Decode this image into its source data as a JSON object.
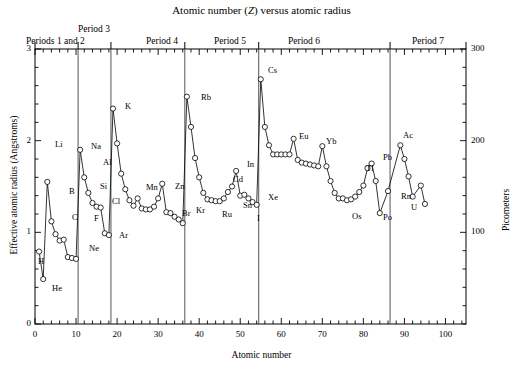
{
  "title": "Atomic number (Z) versus atomic radius",
  "title_parts": {
    "before": "Atomic number (",
    "italic": "Z",
    "after": ") versus atomic radius"
  },
  "axes": {
    "x": {
      "label": "Atomic number",
      "min": 0,
      "max": 105,
      "major_ticks": [
        0,
        10,
        20,
        30,
        40,
        50,
        60,
        70,
        80,
        90,
        100
      ],
      "minor_step": 2
    },
    "y_left": {
      "label": "Effective atomic radius (Angstroms)",
      "min": 0,
      "max": 3,
      "major_ticks": [
        0,
        1,
        2,
        3
      ],
      "minor_step": 0.2
    },
    "y_right": {
      "label": "Picometers",
      "min": 0,
      "max": 300,
      "major_ticks": [
        100,
        200,
        300
      ],
      "minor_step": 20
    }
  },
  "period_headers": [
    {
      "id": "p12",
      "label": "Periods 1 and 2"
    },
    {
      "id": "p3",
      "label": "Period 3"
    },
    {
      "id": "p4",
      "label": "Period 4"
    },
    {
      "id": "p5",
      "label": "Period 5"
    },
    {
      "id": "p6",
      "label": "Period 6"
    },
    {
      "id": "p7",
      "label": "Period 7"
    }
  ],
  "period_dividers_z": [
    10.5,
    18.5,
    36.5,
    54.5,
    86.5
  ],
  "style": {
    "line_color": "#000000",
    "marker_fill": "#ffffff",
    "divider_color": "#555555",
    "frame_color": "#000000"
  },
  "chart_data": {
    "type": "line",
    "title": "Atomic number (Z) versus atomic radius",
    "xlabel": "Atomic number",
    "ylabel": "Effective atomic radius (Angstroms)",
    "y2label": "Picometers",
    "xlim": [
      0,
      105
    ],
    "ylim": [
      0,
      3
    ],
    "y2lim": [
      0,
      300
    ],
    "grid": false,
    "legend": "none",
    "marker": "open-circle",
    "x": [
      1,
      2,
      3,
      4,
      5,
      6,
      7,
      8,
      9,
      10,
      11,
      12,
      13,
      14,
      15,
      16,
      17,
      18,
      19,
      20,
      21,
      22,
      23,
      24,
      25,
      26,
      27,
      28,
      29,
      30,
      31,
      32,
      33,
      34,
      35,
      36,
      37,
      38,
      39,
      40,
      41,
      42,
      43,
      44,
      45,
      46,
      47,
      48,
      49,
      50,
      51,
      52,
      53,
      54,
      55,
      56,
      57,
      58,
      59,
      60,
      61,
      62,
      63,
      64,
      65,
      66,
      67,
      68,
      69,
      70,
      71,
      72,
      73,
      74,
      75,
      76,
      77,
      78,
      79,
      80,
      81,
      82,
      83,
      84,
      86,
      89,
      90,
      91,
      92,
      94,
      95
    ],
    "values": [
      0.79,
      0.49,
      1.55,
      1.12,
      0.98,
      0.91,
      0.92,
      0.73,
      0.72,
      0.71,
      1.9,
      1.6,
      1.43,
      1.32,
      1.28,
      1.27,
      0.99,
      0.97,
      2.35,
      1.97,
      1.64,
      1.47,
      1.35,
      1.29,
      1.37,
      1.26,
      1.25,
      1.25,
      1.28,
      1.37,
      1.53,
      1.22,
      1.21,
      1.17,
      1.14,
      1.1,
      2.48,
      2.15,
      1.81,
      1.6,
      1.43,
      1.36,
      1.35,
      1.34,
      1.34,
      1.37,
      1.44,
      1.5,
      1.67,
      1.4,
      1.41,
      1.37,
      1.33,
      1.3,
      2.67,
      2.15,
      1.95,
      1.85,
      1.85,
      1.85,
      1.85,
      1.85,
      2.02,
      1.79,
      1.76,
      1.75,
      1.74,
      1.73,
      1.72,
      1.94,
      1.72,
      1.56,
      1.43,
      1.37,
      1.37,
      1.35,
      1.36,
      1.39,
      1.44,
      1.51,
      1.7,
      1.75,
      1.56,
      1.21,
      1.45,
      1.95,
      1.8,
      1.61,
      1.39,
      1.51,
      1.31
    ],
    "annotations": [
      {
        "label": "H",
        "z": 1
      },
      {
        "label": "He",
        "z": 2
      },
      {
        "label": "Li",
        "z": 3
      },
      {
        "label": "B",
        "z": 5
      },
      {
        "label": "C",
        "z": 6
      },
      {
        "label": "F",
        "z": 9
      },
      {
        "label": "Ne",
        "z": 10
      },
      {
        "label": "Na",
        "z": 11
      },
      {
        "label": "Al",
        "z": 13
      },
      {
        "label": "Si",
        "z": 14
      },
      {
        "label": "Cl",
        "z": 17
      },
      {
        "label": "Ar",
        "z": 18
      },
      {
        "label": "K",
        "z": 19
      },
      {
        "label": "Mn",
        "z": 25
      },
      {
        "label": "Zn",
        "z": 30
      },
      {
        "label": "Br",
        "z": 35
      },
      {
        "label": "Kr",
        "z": 36
      },
      {
        "label": "Rb",
        "z": 37
      },
      {
        "label": "Ru",
        "z": 44
      },
      {
        "label": "Cd",
        "z": 48
      },
      {
        "label": "In",
        "z": 49
      },
      {
        "label": "Sn",
        "z": 50
      },
      {
        "label": "I",
        "z": 53
      },
      {
        "label": "Xe",
        "z": 54
      },
      {
        "label": "Cs",
        "z": 55
      },
      {
        "label": "Eu",
        "z": 63
      },
      {
        "label": "Yb",
        "z": 70
      },
      {
        "label": "Os",
        "z": 76
      },
      {
        "label": "Tl",
        "z": 81
      },
      {
        "label": "Pb",
        "z": 82
      },
      {
        "label": "Po",
        "z": 84
      },
      {
        "label": "Rn",
        "z": 86
      },
      {
        "label": "Ac",
        "z": 89
      },
      {
        "label": "U",
        "z": 92
      }
    ]
  },
  "element_label_positions": [
    {
      "label": "H",
      "x": 38,
      "y": 256
    },
    {
      "label": "He",
      "x": 52,
      "y": 283
    },
    {
      "label": "Li",
      "x": 55,
      "y": 139
    },
    {
      "label": "B",
      "x": 69,
      "y": 186
    },
    {
      "label": "C",
      "x": 72,
      "y": 212
    },
    {
      "label": "F",
      "x": 94,
      "y": 213
    },
    {
      "label": "Ne",
      "x": 89,
      "y": 243
    },
    {
      "label": "Na",
      "x": 91,
      "y": 141
    },
    {
      "label": "Al",
      "x": 103,
      "y": 157
    },
    {
      "label": "Si",
      "x": 100,
      "y": 181
    },
    {
      "label": "Cl",
      "x": 112,
      "y": 196
    },
    {
      "label": "Ar",
      "x": 119,
      "y": 230
    },
    {
      "label": "K",
      "x": 125,
      "y": 101
    },
    {
      "label": "Mn",
      "x": 146,
      "y": 182
    },
    {
      "label": "Zn",
      "x": 175,
      "y": 181
    },
    {
      "label": "Br",
      "x": 182,
      "y": 208
    },
    {
      "label": "Kr",
      "x": 196,
      "y": 205
    },
    {
      "label": "Rb",
      "x": 201,
      "y": 92
    },
    {
      "label": "Ru",
      "x": 222,
      "y": 209
    },
    {
      "label": "Cd",
      "x": 233,
      "y": 174
    },
    {
      "label": "In",
      "x": 247,
      "y": 159
    },
    {
      "label": "Sn",
      "x": 243,
      "y": 200
    },
    {
      "label": "I",
      "x": 257,
      "y": 213
    },
    {
      "label": "Xe",
      "x": 268,
      "y": 192
    },
    {
      "label": "Cs",
      "x": 268,
      "y": 65
    },
    {
      "label": "Eu",
      "x": 299,
      "y": 131
    },
    {
      "label": "Yb",
      "x": 326,
      "y": 136
    },
    {
      "label": "Os",
      "x": 352,
      "y": 211
    },
    {
      "label": "Tl",
      "x": 366,
      "y": 163
    },
    {
      "label": "Pb",
      "x": 383,
      "y": 152
    },
    {
      "label": "Po",
      "x": 383,
      "y": 212
    },
    {
      "label": "Rn",
      "x": 401,
      "y": 191
    },
    {
      "label": "Ac",
      "x": 403,
      "y": 130
    },
    {
      "label": "U",
      "x": 411,
      "y": 202
    }
  ],
  "caption": ""
}
